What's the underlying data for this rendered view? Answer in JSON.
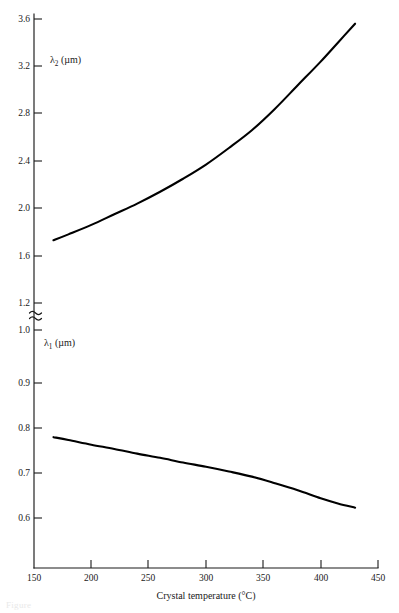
{
  "figure": {
    "background_color": "#ffffff",
    "ink_color": "#000000",
    "caption_fragment": "Figure"
  },
  "axes": {
    "x": {
      "label": "Crystal temperature (°C)",
      "unit": "°C",
      "ticks": [
        150,
        200,
        250,
        300,
        350,
        400,
        450
      ],
      "tick_labels": [
        "150",
        "200",
        "250",
        "300",
        "350",
        "400",
        "450"
      ],
      "range": [
        150,
        450
      ],
      "pixel_range": [
        34,
        378
      ]
    },
    "y_upper": {
      "name": "λ2 (µm)",
      "symbol": "λ",
      "subscript": "2",
      "unit": "(µm)",
      "ticks": [
        1.2,
        1.6,
        2.0,
        2.4,
        2.8,
        3.2,
        3.6
      ],
      "tick_labels": [
        "1.2",
        "1.6",
        "2.0",
        "2.4",
        "2.8",
        "3.2",
        "3.6"
      ],
      "range": [
        1.2,
        3.6
      ],
      "pixel_range_top_bottom": [
        19,
        303
      ]
    },
    "y_lower": {
      "name": "λ1 (µm)",
      "symbol": "λ",
      "subscript": "1",
      "unit": "(µm)",
      "ticks": [
        0.6,
        0.7,
        0.8,
        0.9,
        1.0
      ],
      "tick_labels": [
        "0.6",
        "0.7",
        "0.8",
        "0.9",
        "1.0"
      ],
      "range": [
        0.6,
        1.0
      ],
      "pixel_range_top_bottom": [
        330,
        518
      ]
    },
    "break_symbol": "≈"
  },
  "chart_data": {
    "type": "line",
    "title": "",
    "subtitle": "",
    "xlabel": "Crystal temperature (°C)",
    "ylabel": "Wavelength (µm)",
    "xlim": [
      150,
      450
    ],
    "grid": false,
    "legend": "none",
    "broken_y_axis": true,
    "annotations": [
      "λ2 (µm)",
      "λ1 (µm)"
    ],
    "series": [
      {
        "name": "λ2 (µm)",
        "axis": "y_upper",
        "ylim": [
          1.2,
          3.6
        ],
        "x": [
          167,
          180,
          200,
          220,
          240,
          260,
          280,
          300,
          320,
          340,
          360,
          380,
          400,
          415,
          430
        ],
        "values": [
          1.73,
          1.78,
          1.86,
          1.95,
          2.04,
          2.14,
          2.25,
          2.37,
          2.51,
          2.66,
          2.84,
          3.04,
          3.24,
          3.4,
          3.56
        ]
      },
      {
        "name": "λ1 (µm)",
        "axis": "y_lower",
        "ylim": [
          0.6,
          1.0
        ],
        "x": [
          167,
          180,
          200,
          220,
          240,
          260,
          280,
          300,
          320,
          340,
          360,
          380,
          400,
          415,
          430
        ],
        "values": [
          0.772,
          0.766,
          0.756,
          0.747,
          0.737,
          0.728,
          0.718,
          0.709,
          0.699,
          0.688,
          0.674,
          0.659,
          0.642,
          0.631,
          0.622
        ]
      }
    ]
  }
}
